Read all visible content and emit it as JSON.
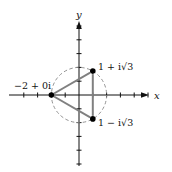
{
  "diagram": {
    "title": "",
    "axes": {
      "x_label": "x",
      "y_label": "y",
      "origin_px": [
        79,
        95
      ],
      "unit_px": 13.8,
      "x_ticks": [
        -4,
        -3,
        -2,
        -1,
        1,
        2,
        3,
        4,
        5
      ],
      "y_ticks": [
        -5,
        -4,
        -3,
        -2,
        -1,
        1,
        2,
        3,
        4,
        5
      ]
    },
    "circle": {
      "center": [
        0,
        0
      ],
      "radius": 2,
      "style": "dashed"
    },
    "points": [
      {
        "id": "p1",
        "label": "−2 + 0i",
        "x": -2,
        "y": 0
      },
      {
        "id": "p2",
        "label": "1 + i√3",
        "x": 1,
        "y": 1.732
      },
      {
        "id": "p3",
        "label": "1 − i√3",
        "x": 1,
        "y": -1.732
      }
    ],
    "triangle": [
      "p1",
      "p2",
      "p3"
    ],
    "colors": {
      "triangle": "#808080",
      "circle": "#888888",
      "axes": "#111111",
      "points": "#000000"
    }
  }
}
